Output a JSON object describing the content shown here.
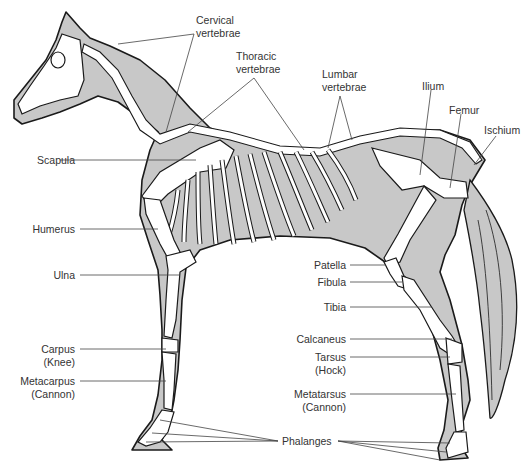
{
  "diagram": {
    "colors": {
      "body_fill": "#c8c8c8",
      "outline": "#1a1a1a",
      "bone_fill": "#ffffff",
      "leader_line": "#444444",
      "text": "#333333"
    }
  },
  "labels": {
    "cervical": {
      "line1": "Cervical",
      "line2": "vertebrae"
    },
    "thoracic": {
      "line1": "Thoracic",
      "line2": "vertebrae"
    },
    "lumbar": {
      "line1": "Lumbar",
      "line2": "vertebrae"
    },
    "ilium": {
      "line1": "Ilium"
    },
    "femur": {
      "line1": "Femur"
    },
    "ischium": {
      "line1": "Ischium"
    },
    "scapula": {
      "line1": "Scapula"
    },
    "humerus": {
      "line1": "Humerus"
    },
    "ulna": {
      "line1": "Ulna"
    },
    "carpus": {
      "line1": "Carpus",
      "line2": "(Knee)"
    },
    "metacarpus": {
      "line1": "Metacarpus",
      "line2": "(Cannon)"
    },
    "patella": {
      "line1": "Patella"
    },
    "fibula": {
      "line1": "Fibula"
    },
    "tibia": {
      "line1": "Tibia"
    },
    "calcaneus": {
      "line1": "Calcaneus"
    },
    "tarsus": {
      "line1": "Tarsus",
      "line2": "(Hock)"
    },
    "metatarsus": {
      "line1": "Metatarsus",
      "line2": "(Cannon)"
    },
    "phalanges": {
      "line1": "Phalanges"
    }
  }
}
